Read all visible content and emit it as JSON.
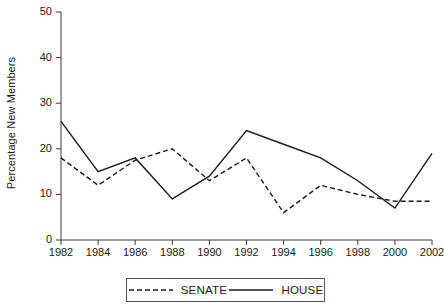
{
  "chart_data": {
    "type": "line",
    "title": "",
    "subtitle": "",
    "xlabel": "",
    "ylabel": "Percentage New Members",
    "x": [
      1982,
      1984,
      1986,
      1988,
      1990,
      1992,
      1994,
      1996,
      1998,
      2000,
      2002
    ],
    "xtick_labels": [
      "1982",
      "1984",
      "1986",
      "1988",
      "1990",
      "1992",
      "1994",
      "1996",
      "1998",
      "2000",
      "2002"
    ],
    "ytick_labels": [
      "0",
      "10",
      "20",
      "30",
      "40",
      "50"
    ],
    "yticks": [
      0,
      10,
      20,
      30,
      40,
      50
    ],
    "xlim": [
      1982,
      2002
    ],
    "ylim": [
      0,
      50
    ],
    "grid": false,
    "legend_position": "bottom-center",
    "series": [
      {
        "name": "SENATE",
        "style": "dashed",
        "color": "#1a1a1a",
        "values": [
          18,
          12,
          17.5,
          20,
          13,
          18,
          6,
          12,
          10,
          8.5,
          8.5
        ]
      },
      {
        "name": "HOUSE",
        "style": "solid",
        "color": "#1a1a1a",
        "values": [
          26,
          15,
          18,
          9,
          14,
          24,
          21,
          18,
          13,
          7,
          19
        ]
      }
    ],
    "legend": [
      {
        "label": "SENATE",
        "style": "dashed"
      },
      {
        "label": "HOUSE",
        "style": "solid"
      }
    ]
  },
  "axes": {
    "y_title": "Percentage New Members"
  }
}
